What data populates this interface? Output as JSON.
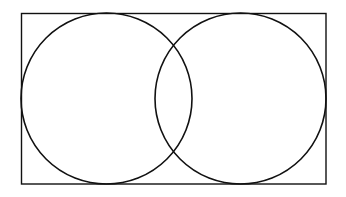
{
  "diagram": {
    "type": "venn",
    "stroke_color": "#111111",
    "background": "#ffffff",
    "rectangle": {
      "x": 21.5,
      "y": 13.5,
      "width": 304.5,
      "height": 170.5
    },
    "circles": [
      {
        "name": "left-circle",
        "cx": 106.5,
        "cy": 98.5,
        "r": 85.5
      },
      {
        "name": "right-circle",
        "cx": 240.5,
        "cy": 98.5,
        "r": 85.5
      }
    ]
  }
}
